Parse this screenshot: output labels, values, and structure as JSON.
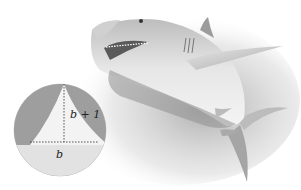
{
  "figure": {
    "inset": {
      "shape": "triangle",
      "description": "magnified shark tooth modeled as triangle",
      "height_label": "b + 1",
      "base_label": "b"
    },
    "colors": {
      "background": "#ffffff",
      "shark_light": "#d9d9d9",
      "shark_dark": "#8a8a8a",
      "inset_circle": "#b8b8b8",
      "tooth": "#f4f4f4",
      "dashed_line": "#333333"
    }
  }
}
